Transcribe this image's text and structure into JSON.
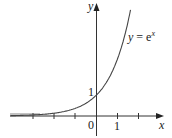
{
  "chart_data": {
    "type": "line",
    "title": "",
    "function": "y = e^x",
    "xlabel": "x",
    "ylabel": "y",
    "origin_label": "0",
    "x_tick_labels": [
      {
        "value": 1,
        "label": "1"
      }
    ],
    "y_tick_labels": [
      {
        "value": 1,
        "label": "1"
      }
    ],
    "x_ticks": [
      -3,
      -2,
      -1,
      0,
      1,
      2
    ],
    "xlim": [
      -3.0,
      3.1
    ],
    "ylim": [
      -0.8,
      5.3
    ],
    "grid": false,
    "legend": "none",
    "annotations": [
      {
        "text": "y = e^x",
        "near_x": 1.5,
        "near_y": 3.5
      }
    ],
    "series": [
      {
        "name": "y = e^x",
        "x": [
          -3,
          -2.5,
          -2,
          -1.5,
          -1,
          -0.5,
          0,
          0.5,
          1,
          1.5,
          1.66
        ],
        "values": [
          0.05,
          0.08,
          0.135,
          0.22,
          0.37,
          0.61,
          1,
          1.65,
          2.72,
          4.48,
          5.26
        ]
      }
    ]
  },
  "labels": {
    "y_axis": "y",
    "x_axis": "x",
    "origin": "0",
    "x_one": "1",
    "y_one": "1",
    "curve_y": "y",
    "curve_eq": " = e",
    "curve_exp": "x"
  }
}
